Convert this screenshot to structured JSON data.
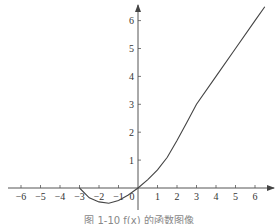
{
  "chart_data": {
    "type": "line",
    "title": "",
    "xlabel": "",
    "ylabel": "",
    "xlim": [
      -6.5,
      6.8
    ],
    "ylim": [
      -0.9,
      6.8
    ],
    "grid": false,
    "legend": null,
    "x_ticks": [
      -6,
      -5,
      -4,
      -3,
      -2,
      -1,
      0,
      1,
      2,
      3,
      4,
      5,
      6
    ],
    "y_ticks": [
      1,
      2,
      3,
      4,
      5,
      6
    ],
    "x_tick_labels": [
      "-6",
      "-5",
      "-4",
      "-3",
      "-2",
      "-1",
      "0",
      "1",
      "2",
      "3",
      "4",
      "5",
      "6"
    ],
    "y_tick_labels": [
      "1",
      "2",
      "3",
      "4",
      "5",
      "6"
    ],
    "series": [
      {
        "name": "f(x)",
        "x": [
          -3,
          -2.5,
          -2,
          -1.5,
          -1,
          -0.5,
          0,
          0.5,
          1,
          1.5,
          2,
          2.5,
          3,
          4,
          5,
          6,
          6.5
        ],
        "y": [
          0,
          -0.35,
          -0.5,
          -0.55,
          -0.45,
          -0.25,
          0,
          0.3,
          0.65,
          1.1,
          1.7,
          2.35,
          3.0,
          4.0,
          5.0,
          6.0,
          6.5
        ]
      }
    ]
  },
  "caption": "图 1-10  f(x) 的函数图像"
}
